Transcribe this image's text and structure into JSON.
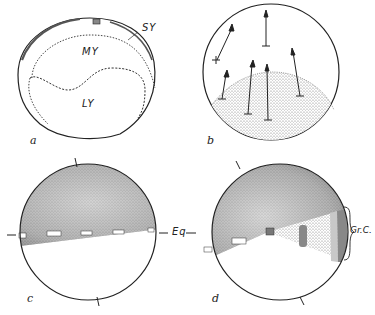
{
  "figure": {
    "panels": [
      {
        "id": "a",
        "letter": "a",
        "labels": {
          "sy": "SY",
          "my": "MY",
          "ly": "LY"
        }
      },
      {
        "id": "b",
        "letter": "b"
      },
      {
        "id": "c",
        "letter": "c",
        "labels": {
          "eq": "Eq"
        }
      },
      {
        "id": "d",
        "letter": "d",
        "labels": {
          "grc": "Gr.C."
        }
      }
    ],
    "colors": {
      "ink": "#222222",
      "background": "#ffffff",
      "stipple": "#888888"
    }
  }
}
